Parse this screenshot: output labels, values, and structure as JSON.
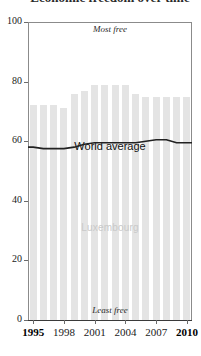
{
  "chart_data": {
    "type": "bar",
    "title": "Economic freedom over time",
    "subtitle": "",
    "xlabel": "",
    "ylabel": "",
    "ylim": [
      0,
      100
    ],
    "xlim": [
      1995,
      2010
    ],
    "grid": false,
    "legend_position": "inline",
    "categories": [
      "1995",
      "1996",
      "1997",
      "1998",
      "1999",
      "2000",
      "2001",
      "2002",
      "2003",
      "2004",
      "2005",
      "2006",
      "2007",
      "2008",
      "2009",
      "2010"
    ],
    "tick_labels_x": [
      "1995",
      "1998",
      "2001",
      "2004",
      "2007",
      "2010"
    ],
    "tick_labels_y": [
      "0",
      "20",
      "40",
      "60",
      "80",
      "100"
    ],
    "series": [
      {
        "name": "Luxembourg",
        "type": "bar",
        "color": "#e4e4e4",
        "values": [
          72,
          72,
          72,
          71,
          76,
          77,
          79,
          79,
          79,
          79,
          76,
          75,
          75,
          75,
          75,
          75
        ]
      },
      {
        "name": "World average",
        "type": "line",
        "color": "#222222",
        "values": [
          58,
          57.5,
          57.5,
          57.5,
          58,
          59,
          59.5,
          59.5,
          59.5,
          59.5,
          59.5,
          60,
          60.5,
          60.5,
          59.5,
          59.5
        ]
      }
    ],
    "annotations": [
      {
        "name": "most-free",
        "text": "Most free",
        "position": "top-center"
      },
      {
        "name": "least-free",
        "text": "Least free",
        "position": "bottom-center"
      },
      {
        "name": "world-average",
        "text": "World average",
        "position": "center"
      },
      {
        "name": "country",
        "text": "Luxembourg",
        "position": "center-lower"
      }
    ]
  },
  "labels": {
    "most_free": "Most free",
    "least_free": "Least free",
    "world_average": "World average",
    "country": "Luxembourg",
    "title_sliver": "Economic freedom over time"
  },
  "axis": {
    "y": {
      "ticks": [
        {
          "value": "100"
        },
        {
          "value": "80"
        },
        {
          "value": "60"
        },
        {
          "value": "40"
        },
        {
          "value": "20"
        },
        {
          "value": "0"
        }
      ]
    },
    "x": {
      "ticks": [
        {
          "value": "1995"
        },
        {
          "value": "1998"
        },
        {
          "value": "2001"
        },
        {
          "value": "2004"
        },
        {
          "value": "2007"
        },
        {
          "value": "2010"
        }
      ]
    }
  },
  "colors": {
    "bar": "#e4e4e4",
    "line": "#222222",
    "axis": "#6b6b6b",
    "country_label": "#c9c9c9",
    "text": "#1a1a1a"
  }
}
